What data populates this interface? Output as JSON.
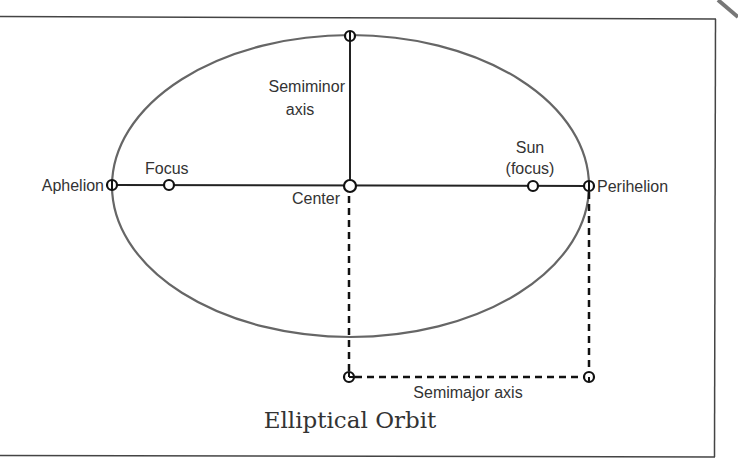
{
  "title": "Elliptical Orbit",
  "labels": {
    "semiminor_line1": "Semiminor",
    "semiminor_line2": "axis",
    "focus": "Focus",
    "aphelion": "Aphelion",
    "center": "Center",
    "sun_line1": "Sun",
    "sun_line2": "(focus)",
    "perihelion": "Perihelion",
    "semimajor": "Semimajor axis"
  },
  "colors": {
    "ellipse": "#666666",
    "lines": "#222222",
    "text": "#333333",
    "frame": "#444444"
  },
  "geometry": {
    "ellipse": {
      "cx": 350.5,
      "cy": 186,
      "rx": 238.5,
      "ry": 151
    },
    "points": {
      "aphelion": [
        112,
        185
      ],
      "focus": [
        169,
        185
      ],
      "center": [
        350,
        186
      ],
      "sun_focus": [
        533,
        186
      ],
      "perihelion": [
        589,
        186
      ],
      "semiminor_top": [
        350,
        36
      ],
      "semimajor_left": [
        349,
        376
      ],
      "semimajor_right": [
        589,
        376
      ]
    }
  }
}
